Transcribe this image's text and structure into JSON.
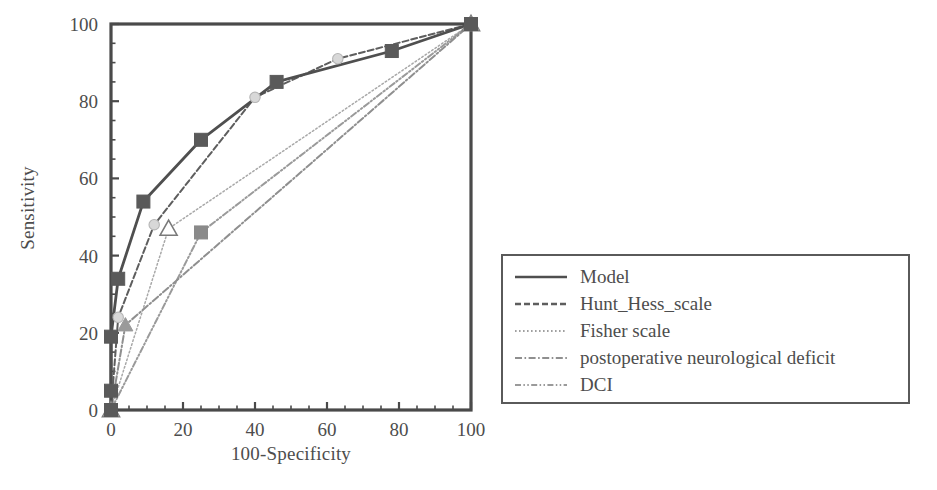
{
  "chart_data": {
    "type": "line",
    "title": "",
    "xlabel": "100-Specificity",
    "ylabel": "Sensitivity",
    "xlim": [
      0,
      100
    ],
    "ylim": [
      0,
      100
    ],
    "xticks": [
      0,
      20,
      40,
      60,
      80,
      100
    ],
    "yticks": [
      0,
      20,
      40,
      60,
      80,
      100
    ],
    "minor_tick_step": 5,
    "grid": false,
    "legend_position": "right",
    "series": [
      {
        "name": "Model",
        "style": "solid",
        "color": "#4f4f4f",
        "marker": "square",
        "marker_color": "#5a5a5a",
        "x": [
          0,
          0,
          0,
          2,
          9,
          25,
          46,
          78,
          100
        ],
        "y": [
          0,
          5,
          19,
          34,
          54,
          70,
          85,
          93,
          100
        ]
      },
      {
        "name": "Hunt_Hess_scale",
        "style": "dashed",
        "color": "#5e5e5e",
        "marker": "circle",
        "marker_color": "#d8d8d8",
        "x": [
          0,
          2,
          12,
          40,
          63,
          100
        ],
        "y": [
          0,
          24,
          48,
          81,
          91,
          100
        ]
      },
      {
        "name": "Fisher scale",
        "style": "dotted",
        "color": "#a8a8a8",
        "marker": "triangle-open",
        "marker_color": "#ffffff",
        "x": [
          0,
          16,
          100
        ],
        "y": [
          0,
          47,
          100
        ]
      },
      {
        "name": "postoperative neurological deficit",
        "style": "dashdot",
        "color": "#8f8f8f",
        "marker": "triangle",
        "marker_color": "#9a9a9a",
        "x": [
          0,
          4,
          100
        ],
        "y": [
          0,
          22,
          100
        ]
      },
      {
        "name": "DCI",
        "style": "dashdotdot",
        "color": "#9a9a9a",
        "marker": "square",
        "marker_color": "#8a8a8a",
        "x": [
          0,
          25,
          100
        ],
        "y": [
          0,
          46,
          100
        ]
      }
    ]
  },
  "axes": {
    "x_title": "100-Specificity",
    "y_title": "Sensitivity",
    "x_tick_labels": [
      "0",
      "20",
      "40",
      "60",
      "80",
      "100"
    ],
    "y_tick_labels": [
      "0",
      "20",
      "40",
      "60",
      "80",
      "100"
    ]
  },
  "legend": {
    "entries": [
      {
        "label": "Model",
        "style": "solid"
      },
      {
        "label": "Hunt_Hess_scale",
        "style": "dashed"
      },
      {
        "label": "Fisher scale",
        "style": "dotted"
      },
      {
        "label": "postoperative neurological deficit",
        "style": "dashdot"
      },
      {
        "label": "DCI",
        "style": "dashdotdot"
      }
    ]
  },
  "colors": {
    "axis": "#4a4a4a",
    "text": "#4d4d4d",
    "legend_border": "#5a5a5a",
    "background": "#ffffff"
  }
}
